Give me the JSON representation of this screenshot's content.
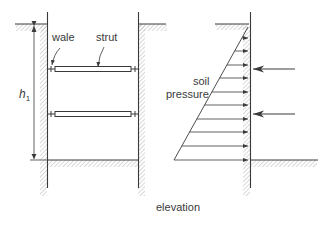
{
  "labels": {
    "wale": "wale",
    "strut": "strut",
    "h": "h",
    "h_sub": "1",
    "soil": "soil",
    "pressure": "pressure",
    "caption": "elevation"
  },
  "colors": {
    "line": "#3a3a3a",
    "hatch": "#9a9a9a",
    "background": "#ffffff"
  }
}
